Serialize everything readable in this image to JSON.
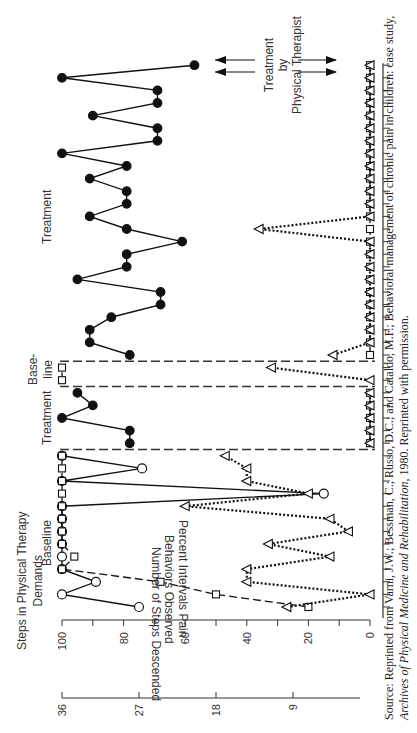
{
  "chart_data": {
    "type": "line",
    "orientation": "rotated-90-ccw",
    "title": "",
    "axes": {
      "left_axis_label": "Steps in Physical Therapy Demands",
      "left_axis_ticks": [
        "36",
        "27",
        "18",
        "9"
      ],
      "left_axis_range": [
        0,
        36
      ],
      "middle_axis_label": "Percent Intervals Pain Behaviors Observed",
      "middle_axis_ticks": [
        "100",
        "80",
        "60",
        "40",
        "20",
        "0"
      ],
      "middle_axis_range": [
        0,
        100
      ],
      "bottom_axis_label": "Number of Steps Descended",
      "x_axis": "Sessions (unlabeled ticks)"
    },
    "phases": [
      {
        "label": "Baseline",
        "sessions": 13
      },
      {
        "label": "Treatment",
        "sessions": 5
      },
      {
        "label": "Base-\nline",
        "sessions": 2
      },
      {
        "label": "Treatment",
        "sessions": 24
      }
    ],
    "annotation": "Treatment by Physical Therapist",
    "series": [
      {
        "name": "Steps in Physical Therapy Demands",
        "marker": "circle",
        "line": "solid",
        "values_pct": [
          75,
          100,
          89,
          100,
          100,
          100,
          100,
          100,
          100,
          15,
          100,
          74,
          100,
          78,
          78,
          100,
          90,
          95,
          null,
          null,
          78,
          91,
          91,
          84,
          68,
          68,
          95,
          79,
          79,
          61,
          79,
          91,
          79,
          79,
          91,
          79,
          100,
          69,
          69,
          90,
          69,
          69,
          100,
          57,
          95
        ]
      },
      {
        "name": "Number of Steps Descended",
        "marker": "square",
        "line": "dashed",
        "values_pct": [
          20,
          50,
          68,
          100,
          96,
          100,
          100,
          100,
          100,
          100,
          100,
          100,
          100,
          0,
          0,
          0,
          0,
          0,
          100,
          100,
          0,
          0,
          0,
          0,
          0,
          0,
          0,
          0,
          0,
          0,
          0,
          0,
          0,
          0,
          0,
          0,
          0,
          0,
          0,
          0,
          0,
          0,
          0,
          0,
          0
        ]
      },
      {
        "name": "Percent Intervals Pain Behaviors Observed",
        "marker": "triangle",
        "line": "dotted",
        "values_pct": [
          27,
          0,
          40,
          40,
          13,
          33,
          7,
          13,
          60,
          20,
          40,
          40,
          47,
          0,
          0,
          0,
          0,
          0,
          0,
          32,
          12,
          0,
          0,
          0,
          0,
          0,
          0,
          0,
          0,
          0,
          36,
          0,
          0,
          0,
          0,
          0,
          0,
          0,
          0,
          0,
          0,
          0,
          0,
          0,
          4
        ]
      }
    ]
  },
  "labels": {
    "left_axis_title": "Steps in Physical Therapy\nDemands",
    "left_axis_title_line1": "Steps in Physical Therapy",
    "left_axis_title_line2": "Demands",
    "middle_axis_title_line1": "Percent Intervals Pain",
    "middle_axis_title_line2": "Behaviors Observed",
    "bottom_axis_title": "Number of Steps Descended",
    "phase_baseline": "Baseline",
    "phase_treatment_1": "Treatment",
    "phase_baseline_2_line1": "Base-",
    "phase_baseline_2_line2": "line",
    "phase_treatment_2": "Treatment",
    "annotation_line1": "Treatment",
    "annotation_line2": "by",
    "annotation_line3": "Physical Therapist"
  },
  "source": {
    "line1": "Source: Reprinted from Varni, J.W.; Bessman, C.; Russo, D.C.; and Cataldo, M.F.; Behavioral management of chronic pain in children: case study,",
    "line2_italic": "Archives of Physical Medicine and Rehabilitation,",
    "line2_rest": " 1980. Reprinted with permission."
  }
}
